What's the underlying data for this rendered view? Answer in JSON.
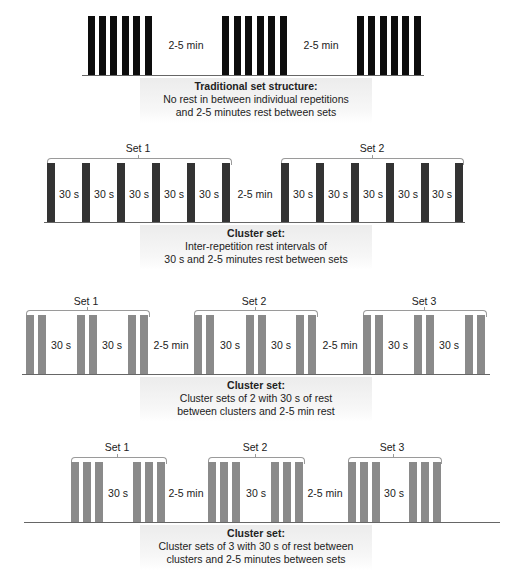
{
  "diagrams": [
    {
      "id": "traditional",
      "rest_labels": [
        "2-5 min",
        "2-5 min"
      ],
      "caption": {
        "title": "Traditional set structure:",
        "line1": "No rest in between individual repetitions",
        "line2": "and 2-5 minutes rest between sets"
      }
    },
    {
      "id": "cluster-inter-rep",
      "sets": [
        "Set 1",
        "Set 2"
      ],
      "intra_labels": [
        "30 s",
        "30 s",
        "30 s",
        "30 s",
        "30 s",
        "30 s",
        "30 s",
        "30 s",
        "30 s",
        "30 s"
      ],
      "rest_labels": [
        "2-5 min"
      ],
      "caption": {
        "title": "Cluster set:",
        "line1": "Inter-repetition rest intervals of",
        "line2": "30 s and 2-5 minutes rest between sets"
      }
    },
    {
      "id": "cluster-of-2",
      "sets": [
        "Set 1",
        "Set 2",
        "Set 3"
      ],
      "intra_labels": [
        "30 s",
        "30 s",
        "30 s",
        "30 s",
        "30 s",
        "30 s"
      ],
      "rest_labels": [
        "2-5 min",
        "2-5 min"
      ],
      "caption": {
        "title": "Cluster set:",
        "line1": "Cluster sets of 2 with 30 s of rest",
        "line2": "between clusters and 2-5 min rest"
      }
    },
    {
      "id": "cluster-of-3",
      "sets": [
        "Set 1",
        "Set 2",
        "Set 3"
      ],
      "intra_labels": [
        "30 s",
        "30 s",
        "30 s"
      ],
      "rest_labels": [
        "2-5 min",
        "2-5 min"
      ],
      "caption": {
        "title": "Cluster set:",
        "line1": "Cluster sets of 3 with 30 s of rest between",
        "line2": "clusters and 2-5 minutes between sets"
      }
    }
  ],
  "colors": {
    "traditional_bar": "#0d0d0d",
    "cluster_inter_rep_bar": "#333333",
    "cluster_group_bar": "#8a8a8a",
    "bracket": "#9a9a9a"
  }
}
